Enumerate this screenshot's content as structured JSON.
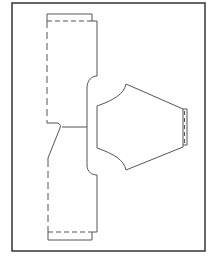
{
  "diagram": {
    "type": "sewing-pattern-layout",
    "frame": {
      "x": 12,
      "y": 3,
      "width": 193,
      "height": 248,
      "stroke": "#333333"
    },
    "stroke_color": "#555555",
    "pieces": [
      {
        "name": "body-piece",
        "description": "Long vertical pattern piece with cut bands at top and bottom and a curved notch on the right"
      },
      {
        "name": "sleeve-piece",
        "description": "Hexagonal sleeve piece with curved armhole edges and a cuff band on the right"
      }
    ],
    "lines": {
      "solid": "cut line",
      "dashed": "fold / seam line"
    }
  }
}
